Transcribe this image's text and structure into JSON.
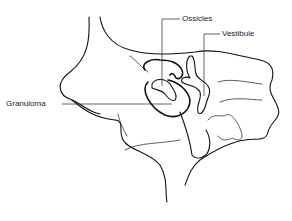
{
  "diagram": {
    "labels": {
      "ossicles": "Ossicles",
      "vestibule": "Vestibule",
      "granuloma": "Granuloma"
    },
    "colors": {
      "line": "#111111",
      "background": "#ffffff"
    }
  }
}
